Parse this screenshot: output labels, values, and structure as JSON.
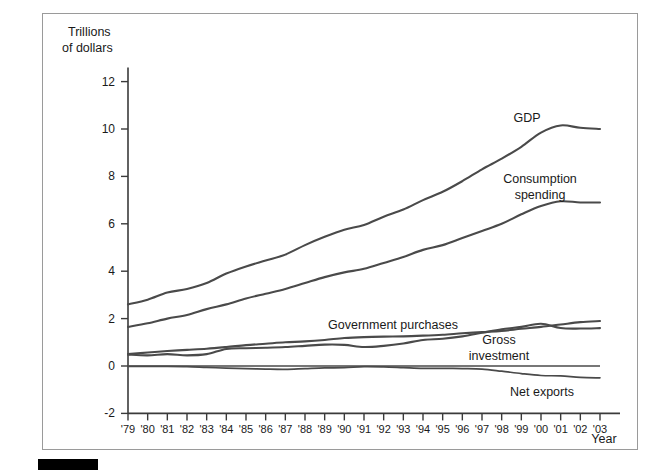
{
  "figure": {
    "yaxis_title_line1": "Trillions",
    "yaxis_title_line2": "of dollars",
    "xaxis_title": "Year",
    "frame_color": "#9a9a9a",
    "line_color": "#4a4a4a",
    "axis_color": "#3a3a3a"
  },
  "labels": {
    "gdp": "GDP",
    "consumption_line1": "Consumption",
    "consumption_line2": "spending",
    "government": "Government purchases",
    "investment_line1": "Gross",
    "investment_line2": "investment",
    "net_exports": "Net exports"
  },
  "chart_data": {
    "type": "line",
    "title": "",
    "xlabel": "Year",
    "ylabel": "Trillions of dollars",
    "xlim": [
      1979,
      2003
    ],
    "ylim": [
      -2,
      12
    ],
    "yticks": [
      -2,
      0,
      2,
      4,
      6,
      8,
      10,
      12
    ],
    "ytick_labels": [
      "-2",
      "0",
      "2",
      "4",
      "6",
      "8",
      "10",
      "12"
    ],
    "x": [
      1979,
      1980,
      1981,
      1982,
      1983,
      1984,
      1985,
      1986,
      1987,
      1988,
      1989,
      1990,
      1991,
      1992,
      1993,
      1994,
      1995,
      1996,
      1997,
      1998,
      1999,
      2000,
      2001,
      2002,
      2003
    ],
    "xtick_labels": [
      "'79",
      "'80",
      "'81",
      "'82",
      "'83",
      "'84",
      "'85",
      "'86",
      "'87",
      "'88",
      "'89",
      "'90",
      "'91",
      "'92",
      "'93",
      "'94",
      "'95",
      "'96",
      "'97",
      "'98",
      "'99",
      "'00",
      "'01",
      "'02",
      "'03"
    ],
    "grid": false,
    "legend": "inline-annotations",
    "series": [
      {
        "name": "GDP",
        "values": [
          2.6,
          2.8,
          3.1,
          3.25,
          3.5,
          3.9,
          4.2,
          4.45,
          4.7,
          5.1,
          5.45,
          5.75,
          5.95,
          6.3,
          6.6,
          7.0,
          7.35,
          7.8,
          8.3,
          8.75,
          9.25,
          9.85,
          10.15,
          10.05,
          10.0
        ]
      },
      {
        "name": "Consumption spending",
        "values": [
          1.65,
          1.8,
          2.0,
          2.15,
          2.4,
          2.6,
          2.85,
          3.05,
          3.25,
          3.5,
          3.75,
          3.95,
          4.1,
          4.35,
          4.6,
          4.9,
          5.1,
          5.4,
          5.7,
          6.0,
          6.4,
          6.75,
          6.95,
          6.9,
          6.9
        ]
      },
      {
        "name": "Government purchases",
        "values": [
          0.5,
          0.57,
          0.63,
          0.68,
          0.73,
          0.8,
          0.88,
          0.94,
          1.0,
          1.04,
          1.1,
          1.18,
          1.22,
          1.24,
          1.25,
          1.28,
          1.32,
          1.38,
          1.43,
          1.48,
          1.57,
          1.65,
          1.75,
          1.85,
          1.9
        ]
      },
      {
        "name": "Gross investment",
        "values": [
          0.48,
          0.45,
          0.5,
          0.45,
          0.5,
          0.72,
          0.75,
          0.77,
          0.8,
          0.85,
          0.9,
          0.89,
          0.8,
          0.85,
          0.95,
          1.1,
          1.15,
          1.25,
          1.4,
          1.55,
          1.65,
          1.78,
          1.6,
          1.58,
          1.6
        ]
      },
      {
        "name": "Net exports",
        "values": [
          -0.02,
          -0.02,
          -0.02,
          -0.03,
          -0.06,
          -0.09,
          -0.11,
          -0.13,
          -0.14,
          -0.11,
          -0.08,
          -0.07,
          -0.03,
          -0.04,
          -0.07,
          -0.1,
          -0.1,
          -0.11,
          -0.13,
          -0.22,
          -0.32,
          -0.4,
          -0.42,
          -0.48,
          -0.5
        ]
      }
    ]
  }
}
